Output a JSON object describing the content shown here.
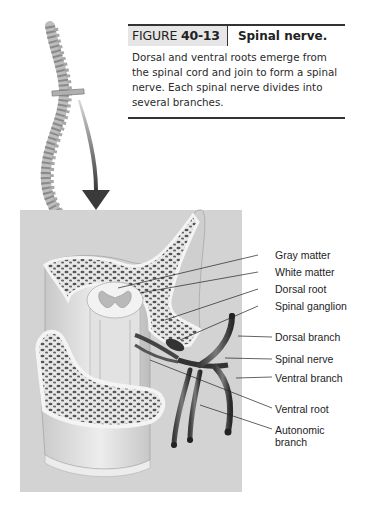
{
  "figure": {
    "label_prefix": "FIGURE",
    "label_number": "40-13",
    "title": "Spinal nerve.",
    "description": "Dorsal and ventral roots emerge from the spinal cord and join to form a spinal nerve. Each spinal nerve divides into several branches."
  },
  "illustration": {
    "background_color": "#d3d3d3",
    "labels": [
      {
        "id": "gray-matter",
        "text": "Gray matter"
      },
      {
        "id": "white-matter",
        "text": "White matter"
      },
      {
        "id": "dorsal-root",
        "text": "Dorsal root"
      },
      {
        "id": "spinal-ganglion",
        "text": "Spinal ganglion"
      },
      {
        "id": "dorsal-branch",
        "text": "Dorsal branch"
      },
      {
        "id": "spinal-nerve",
        "text": "Spinal nerve"
      },
      {
        "id": "ventral-branch",
        "text": "Ventral branch"
      },
      {
        "id": "ventral-root",
        "text": "Ventral root"
      },
      {
        "id": "autonomic-branch",
        "text": "Autonomic\nbranch",
        "line1": "Autonomic",
        "line2": "branch"
      }
    ]
  }
}
